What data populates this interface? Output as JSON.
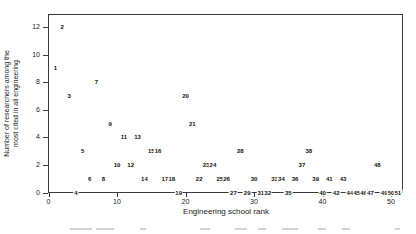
{
  "figure": {
    "y_axis": {
      "title_line1": "Number of researchers among the",
      "title_line2": "most cited in all engineering",
      "ticks": [
        0,
        2,
        4,
        6,
        8,
        10,
        12
      ]
    },
    "x_axis": {
      "title": "Engineering school rank",
      "ticks": [
        0,
        10,
        20,
        30,
        40,
        50
      ]
    }
  },
  "chart_data": {
    "type": "scatter",
    "title": "",
    "xlabel": "Engineering school rank",
    "ylabel": "Number of researchers among the most cited in all engineering",
    "xlim": [
      0,
      52
    ],
    "ylim": [
      0,
      13
    ],
    "grid": false,
    "legend": "none",
    "marker_style": "each data point is drawn as the text of its engineering school rank number",
    "points": [
      {
        "rank": 1,
        "researchers": 9
      },
      {
        "rank": 2,
        "researchers": 12
      },
      {
        "rank": 3,
        "researchers": 7
      },
      {
        "rank": 4,
        "researchers": 0
      },
      {
        "rank": 5,
        "researchers": 3
      },
      {
        "rank": 6,
        "researchers": 1
      },
      {
        "rank": 7,
        "researchers": 8
      },
      {
        "rank": 8,
        "researchers": 1
      },
      {
        "rank": 9,
        "researchers": 5
      },
      {
        "rank": 10,
        "researchers": 2
      },
      {
        "rank": 11,
        "researchers": 4
      },
      {
        "rank": 12,
        "researchers": 2
      },
      {
        "rank": 13,
        "researchers": 4
      },
      {
        "rank": 14,
        "researchers": 1
      },
      {
        "rank": 15,
        "researchers": 3
      },
      {
        "rank": 16,
        "researchers": 3
      },
      {
        "rank": 17,
        "researchers": 1
      },
      {
        "rank": 18,
        "researchers": 1
      },
      {
        "rank": 19,
        "researchers": 0
      },
      {
        "rank": 20,
        "researchers": 7
      },
      {
        "rank": 21,
        "researchers": 5
      },
      {
        "rank": 22,
        "researchers": 1
      },
      {
        "rank": 23,
        "researchers": 2
      },
      {
        "rank": 24,
        "researchers": 2
      },
      {
        "rank": 25,
        "researchers": 1
      },
      {
        "rank": 26,
        "researchers": 1
      },
      {
        "rank": 27,
        "researchers": 0
      },
      {
        "rank": 28,
        "researchers": 3
      },
      {
        "rank": 29,
        "researchers": 0
      },
      {
        "rank": 30,
        "researchers": 1
      },
      {
        "rank": 31,
        "researchers": 0
      },
      {
        "rank": 32,
        "researchers": 0
      },
      {
        "rank": 33,
        "researchers": 1
      },
      {
        "rank": 34,
        "researchers": 1
      },
      {
        "rank": 35,
        "researchers": 0
      },
      {
        "rank": 36,
        "researchers": 1
      },
      {
        "rank": 37,
        "researchers": 2
      },
      {
        "rank": 38,
        "researchers": 3
      },
      {
        "rank": 39,
        "researchers": 1
      },
      {
        "rank": 40,
        "researchers": 0
      },
      {
        "rank": 41,
        "researchers": 1
      },
      {
        "rank": 42,
        "researchers": 0
      },
      {
        "rank": 43,
        "researchers": 1
      },
      {
        "rank": 44,
        "researchers": 0
      },
      {
        "rank": 45,
        "researchers": 0
      },
      {
        "rank": 46,
        "researchers": 0
      },
      {
        "rank": 47,
        "researchers": 0
      },
      {
        "rank": 48,
        "researchers": 2
      },
      {
        "rank": 49,
        "researchers": 0
      },
      {
        "rank": 50,
        "researchers": 0
      },
      {
        "rank": 51,
        "researchers": 0
      }
    ]
  }
}
